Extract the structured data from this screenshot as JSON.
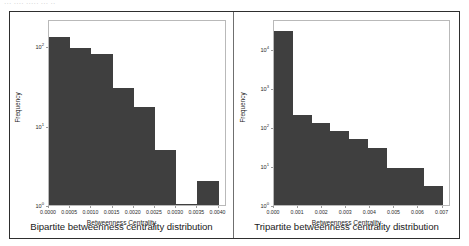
{
  "page": {
    "top_clipped_text": "···  ····  ·····  ··· ··",
    "background_color": "#ffffff",
    "border_color": "#2e2e2e",
    "divider_color": "#6f6f6f",
    "bar_color": "#3f3f3f",
    "axes_edge_color": "#b9b9b9"
  },
  "cells": [
    {
      "caption": "Bipartite betweenness centrality distribution"
    },
    {
      "caption": "Tripartite betweenness centrality distribution"
    }
  ],
  "chart_data": [
    {
      "type": "bar",
      "title": "",
      "panel_caption": "Bipartite betweenness centrality distribution",
      "xlabel": "Betweenness Centrality",
      "ylabel": "Frequency",
      "yscale": "log",
      "xscale": "linear",
      "grid": false,
      "legend": "none",
      "xlim": [
        0.0,
        0.0042
      ],
      "ylim": [
        1,
        220
      ],
      "xticks": [
        0.0,
        0.0005,
        0.001,
        0.0015,
        0.002,
        0.0025,
        0.003,
        0.0035,
        0.004
      ],
      "xtick_labels": [
        "0.0000",
        "0.0005",
        "0.0010",
        "0.0015",
        "0.0020",
        "0.0025",
        "0.0030",
        "0.0035",
        "0.0040"
      ],
      "yticks": [
        1,
        10,
        100
      ],
      "ytick_labels": [
        "10⁰",
        "10¹",
        "10²"
      ],
      "bin_edges": [
        0.0,
        0.0005,
        0.001,
        0.0015,
        0.002,
        0.0025,
        0.003,
        0.0035,
        0.004
      ],
      "values": [
        130,
        95,
        80,
        30,
        17,
        5,
        1,
        2
      ],
      "categories": [
        "0.0000–0.0005",
        "0.0005–0.0010",
        "0.0010–0.0015",
        "0.0015–0.0020",
        "0.0020–0.0025",
        "0.0025–0.0030",
        "0.0030–0.0035",
        "0.0035–0.0040"
      ]
    },
    {
      "type": "bar",
      "title": "",
      "panel_caption": "Tripartite betweenness centrality distribution",
      "xlabel": "Betweenness Centrality",
      "ylabel": "Frequency",
      "yscale": "log",
      "xscale": "linear",
      "grid": false,
      "legend": "none",
      "xlim": [
        0.0,
        0.00735
      ],
      "ylim": [
        1,
        60000
      ],
      "xticks": [
        0.0,
        0.001,
        0.002,
        0.003,
        0.004,
        0.005,
        0.006,
        0.007
      ],
      "xtick_labels": [
        "0.000",
        "0.001",
        "0.002",
        "0.003",
        "0.004",
        "0.005",
        "0.006",
        "0.007"
      ],
      "yticks": [
        1,
        10,
        100,
        1000,
        10000,
        100000
      ],
      "ytick_labels": [
        "10⁰",
        "10¹",
        "10²",
        "10³",
        "10⁴",
        "10⁵"
      ],
      "bin_edges": [
        0.0,
        0.00078,
        0.00156,
        0.00234,
        0.00312,
        0.0039,
        0.00468,
        0.00546,
        0.00624,
        0.00702
      ],
      "values": [
        30000,
        200,
        130,
        80,
        50,
        30,
        9,
        9,
        3
      ],
      "categories": [
        "bin 1",
        "bin 2",
        "bin 3",
        "bin 4",
        "bin 5",
        "bin 6",
        "bin 7",
        "bin 8",
        "bin 9"
      ]
    }
  ]
}
